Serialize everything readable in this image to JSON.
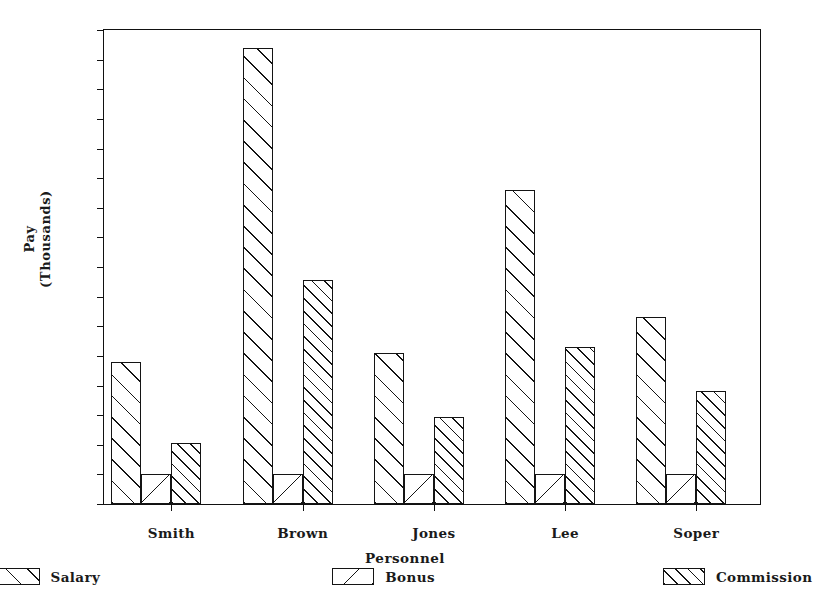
{
  "chart_data": {
    "type": "bar",
    "title": "",
    "subtitle": "",
    "xlabel": "Personnel",
    "ylabel": "Pay\n(Thousands)",
    "ylabel_lines": [
      "Pay",
      "(Thousands)"
    ],
    "categories": [
      "Smith",
      "Brown",
      "Jones",
      "Lee",
      "Soper"
    ],
    "series": [
      {
        "name": "Salary",
        "pattern": "diagonal-forward-wide",
        "values": [
          4.8,
          15.4,
          5.1,
          10.6,
          6.3
        ]
      },
      {
        "name": "Bonus",
        "pattern": "diagonal-backward-wide",
        "values": [
          1.0,
          1.0,
          1.0,
          1.0,
          1.0
        ]
      },
      {
        "name": "Commission",
        "pattern": "diagonal-forward-dense",
        "values": [
          2.05,
          7.55,
          2.95,
          5.3,
          3.8
        ]
      }
    ],
    "ylim": [
      0,
      16
    ],
    "ytick_values": [
      0,
      1,
      2,
      3,
      4,
      5,
      6,
      7,
      8,
      9,
      10,
      11,
      12,
      13,
      14,
      15,
      16
    ],
    "ytick_labels": [
      "0",
      "1",
      "2",
      "3",
      "4",
      "5",
      "6",
      "7",
      "8",
      "9",
      "10",
      "11",
      "12",
      "13",
      "14",
      "15",
      "16"
    ],
    "grid": false,
    "legend_position": "bottom",
    "legend_entries": [
      "Salary",
      "Bonus",
      "Commission"
    ],
    "colors": {
      "axis": "#141414",
      "bar_fill": "#ffffff",
      "bar_edge": "#141414",
      "background": "#ffffff",
      "text": "#1a1a1a"
    }
  }
}
